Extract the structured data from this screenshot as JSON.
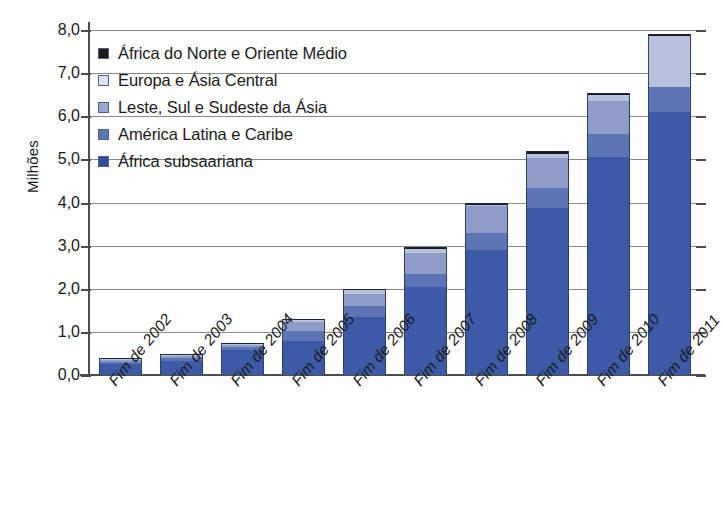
{
  "chart_data": {
    "type": "bar",
    "subtype": "stacked-bar",
    "title": "",
    "xlabel": "",
    "ylabel": "Milhões",
    "ylim": [
      0.0,
      8.0
    ],
    "ytick_step": 1.0,
    "grid": true,
    "legend_position": "upper-left-inside",
    "categories": [
      "Fim de 2002",
      "Fim de 2003",
      "Fim de 2004",
      "Fim de 2005",
      "Fim de 2006",
      "Fim de 2007",
      "Fim de 2008",
      "Fim de 2009",
      "Fim de 2010",
      "Fim de 2011"
    ],
    "ytick_labels": [
      "0,0",
      "1,0",
      "2,0",
      "3,0",
      "4,0",
      "5,0",
      "6,0",
      "7,0",
      "8,0"
    ],
    "ytick_values": [
      0,
      1,
      2,
      3,
      4,
      5,
      6,
      7,
      8
    ],
    "series": [
      {
        "name": "África subsaariana",
        "color": "#3c5aa6",
        "values": [
          0.25,
          0.32,
          0.58,
          0.8,
          1.35,
          2.05,
          2.9,
          3.88,
          5.05,
          6.1
        ]
      },
      {
        "name": "América Latina e Caribe",
        "color": "#5d74b5",
        "values": [
          0.06,
          0.07,
          0.07,
          0.22,
          0.26,
          0.3,
          0.4,
          0.45,
          0.55,
          0.57
        ]
      },
      {
        "name": "Leste, Sul e Sudeste da Ásia",
        "color": "#8e9dc8",
        "values": [
          0.03,
          0.04,
          0.05,
          0.22,
          0.27,
          0.48,
          0.62,
          0.7,
          0.75,
          0.0
        ]
      },
      {
        "name": "Europa e Ásia Central",
        "color": "#b9c2dc",
        "values": [
          0.01,
          0.01,
          0.02,
          0.04,
          0.09,
          0.1,
          0.03,
          0.1,
          0.15,
          1.18
        ]
      },
      {
        "name": "África do Norte e Oriente Médio",
        "color": "#1a1a1a",
        "values": [
          0.01,
          0.01,
          0.01,
          0.02,
          0.03,
          0.04,
          0.05,
          0.06,
          0.05,
          0.05
        ]
      }
    ],
    "totals": [
      0.36,
      0.45,
      0.73,
      1.3,
      2.0,
      2.97,
      4.0,
      5.19,
      6.55,
      7.9
    ]
  },
  "legend": {
    "items": [
      {
        "label": "África do Norte e Oriente Médio",
        "color": "#1a1a1a"
      },
      {
        "label": "Europa e Ásia Central",
        "color": "#dde2f0"
      },
      {
        "label": "Leste, Sul e Sudeste da Ásia",
        "color": "#9aa8cf"
      },
      {
        "label": "América Latina e Caribe",
        "color": "#5d74b5"
      },
      {
        "label": "África subsaariana",
        "color": "#2f4d9e"
      }
    ]
  },
  "axis": {
    "y_title": "Milhões"
  }
}
